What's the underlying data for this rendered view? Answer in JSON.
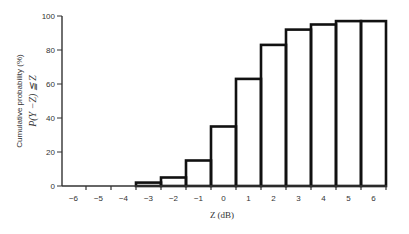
{
  "chart_data": {
    "type": "bar",
    "title": "",
    "xlabel": "Z (dB)",
    "ylabel": "Cumulative probability (%)",
    "ylabel_secondary": "P(Y − Z) ≤ Z",
    "categories": [
      "-6",
      "-5",
      "-4",
      "-3",
      "-2",
      "-1",
      "0",
      "1",
      "2",
      "3",
      "4",
      "5",
      "6"
    ],
    "values": [
      0,
      0,
      0,
      2,
      5,
      15,
      35,
      63,
      83,
      92,
      95,
      97,
      97
    ],
    "ylim": [
      0,
      100
    ],
    "yticks": [
      0,
      20,
      40,
      60,
      80,
      100
    ],
    "xtick_labels": [
      "−6",
      "−5",
      "−4",
      "−3",
      "−2",
      "−1",
      "0",
      "1",
      "2",
      "3",
      "4",
      "5",
      "6"
    ],
    "grid": false,
    "legend": null
  },
  "labels": {
    "ylabel": "Cumulative probability (%)",
    "ylabel_secondary": "P(Y −Z) ≦ Z",
    "xlabel": "Z (dB)"
  }
}
